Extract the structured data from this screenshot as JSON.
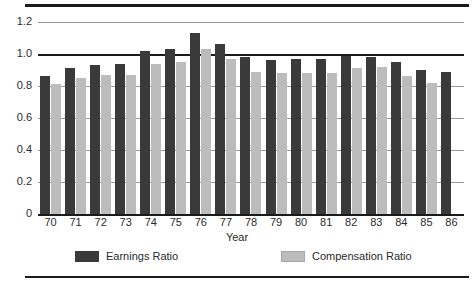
{
  "chart_data": {
    "type": "bar",
    "title": "",
    "xlabel": "Year",
    "ylabel": "",
    "ylim": [
      0,
      1.2
    ],
    "yticks": [
      "0",
      "0.2",
      "0.4",
      "0.6",
      "0.8",
      "1.0",
      "1.2"
    ],
    "ytick_values": [
      0,
      0.2,
      0.4,
      0.6,
      0.8,
      1.0,
      1.2
    ],
    "grid": true,
    "legend_position": "bottom",
    "categories": [
      "70",
      "71",
      "72",
      "73",
      "74",
      "75",
      "76",
      "77",
      "78",
      "79",
      "80",
      "81",
      "82",
      "83",
      "84",
      "85",
      "86"
    ],
    "series": [
      {
        "name": "Earnings Ratio",
        "color": "#3a3a3a",
        "values": [
          0.86,
          0.91,
          0.93,
          0.94,
          1.02,
          1.03,
          1.13,
          1.06,
          0.98,
          0.96,
          0.97,
          0.97,
          0.99,
          0.98,
          0.95,
          0.9,
          0.89
        ]
      },
      {
        "name": "Compensation Ratio",
        "color": "#bcbcbc",
        "values": [
          0.81,
          0.85,
          0.87,
          0.87,
          0.94,
          0.95,
          1.03,
          0.97,
          0.89,
          0.88,
          0.88,
          0.88,
          0.91,
          0.92,
          0.86,
          0.82,
          null
        ]
      }
    ]
  },
  "legend": {
    "items": [
      {
        "label": "Earnings Ratio",
        "swatch": "dark-swatch"
      },
      {
        "label": "Compensation Ratio",
        "swatch": "light-swatch"
      }
    ]
  },
  "axis": {
    "x_title": "Year"
  }
}
